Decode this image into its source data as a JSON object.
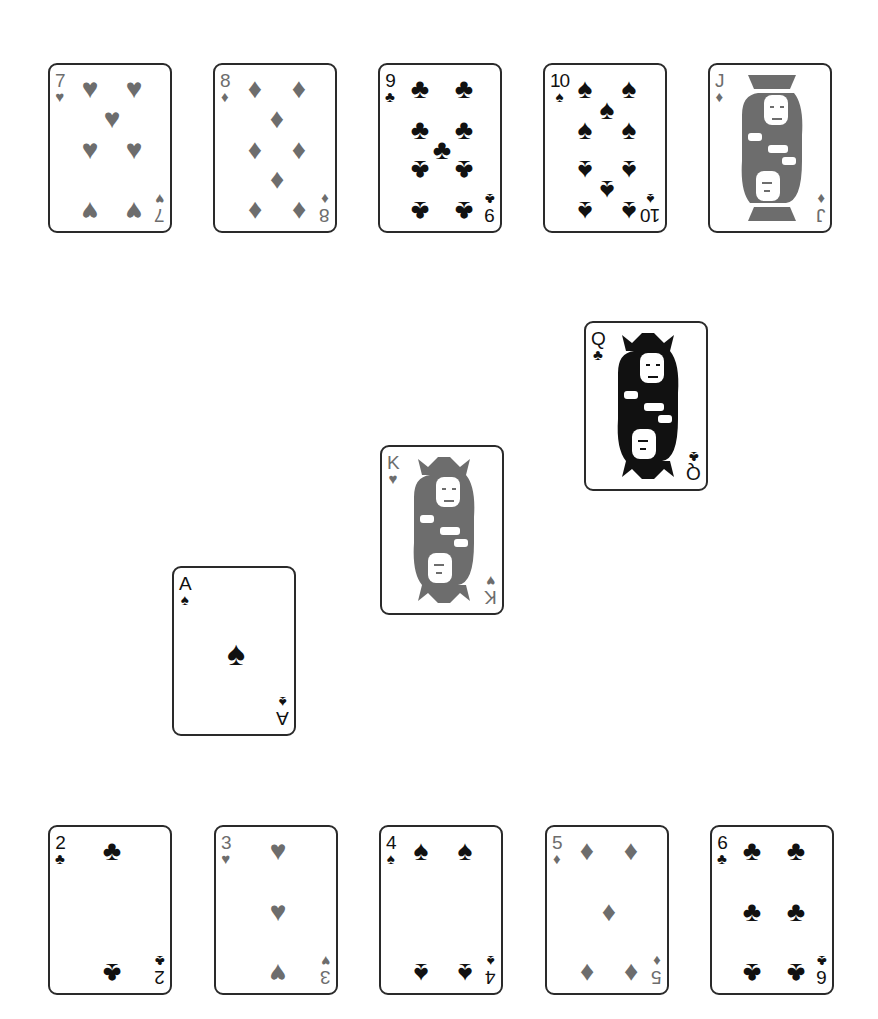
{
  "colors": {
    "red_suit": "#6d6d6d",
    "black_suit": "#111111",
    "card_border": "#2a2a2a",
    "background": "#ffffff"
  },
  "cards": [
    {
      "id": "7h",
      "rank": "7",
      "suit": "hearts",
      "symbol": "♥",
      "color": "red",
      "x": 48,
      "y": 63
    },
    {
      "id": "8d",
      "rank": "8",
      "suit": "diamonds",
      "symbol": "♦",
      "color": "red",
      "x": 213,
      "y": 63
    },
    {
      "id": "9c",
      "rank": "9",
      "suit": "clubs",
      "symbol": "♣",
      "color": "black",
      "x": 378,
      "y": 63
    },
    {
      "id": "10s",
      "rank": "10",
      "suit": "spades",
      "symbol": "♠",
      "color": "black",
      "x": 543,
      "y": 63
    },
    {
      "id": "jd",
      "rank": "J",
      "suit": "diamonds",
      "symbol": "♦",
      "color": "red",
      "x": 708,
      "y": 63
    },
    {
      "id": "qc",
      "rank": "Q",
      "suit": "clubs",
      "symbol": "♣",
      "color": "black",
      "x": 584,
      "y": 321
    },
    {
      "id": "kh",
      "rank": "K",
      "suit": "hearts",
      "symbol": "♥",
      "color": "red",
      "x": 380,
      "y": 445
    },
    {
      "id": "as",
      "rank": "A",
      "suit": "spades",
      "symbol": "♠",
      "color": "black",
      "x": 172,
      "y": 566
    },
    {
      "id": "2c",
      "rank": "2",
      "suit": "clubs",
      "symbol": "♣",
      "color": "black",
      "x": 48,
      "y": 825
    },
    {
      "id": "3h",
      "rank": "3",
      "suit": "hearts",
      "symbol": "♥",
      "color": "red",
      "x": 214,
      "y": 825
    },
    {
      "id": "4s",
      "rank": "4",
      "suit": "spades",
      "symbol": "♠",
      "color": "black",
      "x": 379,
      "y": 825
    },
    {
      "id": "5d",
      "rank": "5",
      "suit": "diamonds",
      "symbol": "♦",
      "color": "red",
      "x": 545,
      "y": 825
    },
    {
      "id": "6c",
      "rank": "6",
      "suit": "clubs",
      "symbol": "♣",
      "color": "black",
      "x": 710,
      "y": 825
    }
  ]
}
